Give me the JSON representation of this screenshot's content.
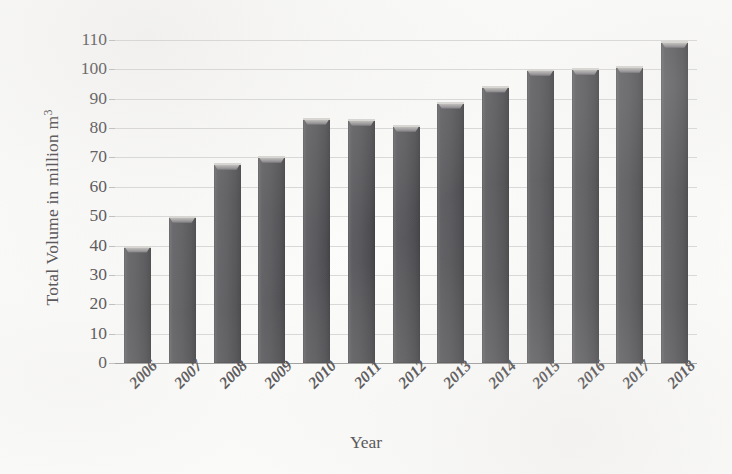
{
  "chart_data": {
    "type": "bar",
    "title": "",
    "xlabel": "Year",
    "ylabel": "Total Volume in million m³",
    "ylabel_base": "Total Volume in million m",
    "ylabel_sup": "3",
    "categories": [
      "2006",
      "2007",
      "2008",
      "2009",
      "2010",
      "2011",
      "2012",
      "2013",
      "2014",
      "2015",
      "2016",
      "2017",
      "2018"
    ],
    "values": [
      40,
      50,
      68,
      70.5,
      83.5,
      83,
      81,
      89,
      94.5,
      100,
      100.5,
      101,
      109.5
    ],
    "series": [
      {
        "name": "Total Volume",
        "values": [
          40,
          50,
          68,
          70.5,
          83.5,
          83,
          81,
          89,
          94.5,
          100,
          100.5,
          101,
          109.5
        ]
      }
    ],
    "ylim": [
      0,
      110
    ],
    "ytick_step": 10,
    "yticks": [
      0,
      10,
      20,
      30,
      40,
      50,
      60,
      70,
      80,
      90,
      100,
      110
    ],
    "ytick_labels": [
      "0",
      "10",
      "20",
      "30",
      "40",
      "50",
      "60",
      "70",
      "80",
      "90",
      "100",
      "110"
    ],
    "grid": true,
    "grid_axis": "y",
    "legend": false,
    "legend_position": "none",
    "xtick_rotation": -45,
    "bar_color": "#555458",
    "grid_color": "#d9d9d9",
    "axis_color": "#9c9c9c",
    "text_color": "#49474a",
    "background_color": "#fdfdfc"
  }
}
